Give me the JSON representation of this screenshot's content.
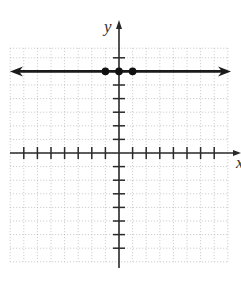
{
  "graph": {
    "axes": {
      "x_label": "x",
      "y_label": "y"
    },
    "grid": {
      "x_min": -8,
      "x_max": 8,
      "y_min": -8,
      "y_max": 8,
      "step": 1,
      "style": "dotted"
    },
    "line": {
      "equation": "y = 6",
      "type": "horizontal",
      "y": 6,
      "arrows": "both"
    },
    "points": [
      {
        "x": -1,
        "y": 6
      },
      {
        "x": 0,
        "y": 6
      },
      {
        "x": 1,
        "y": 6
      }
    ],
    "colors": {
      "axis": "#2a2a2a",
      "grid": "#b5b5b5",
      "line": "#1a1a1a",
      "point": "#111111"
    }
  }
}
